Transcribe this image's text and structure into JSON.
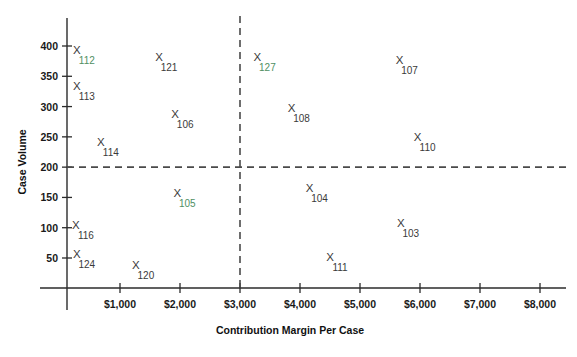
{
  "chart_data": {
    "type": "scatter",
    "title": "",
    "xlabel": "Contribution Margin Per Case",
    "ylabel": "Case Volume",
    "xlim": [
      0,
      8000
    ],
    "ylim": [
      0,
      430
    ],
    "grid": false,
    "legend": null,
    "xticks": [
      1000,
      2000,
      3000,
      4000,
      5000,
      6000,
      7000,
      8000
    ],
    "xtick_labels": [
      "$1,000",
      "$2,000",
      "$3,000",
      "$4,000",
      "$5,000",
      "$6,000",
      "$7,000",
      "$8,000"
    ],
    "yticks": [
      50,
      100,
      150,
      200,
      250,
      300,
      350,
      400
    ],
    "ytick_labels": [
      "50",
      "100",
      "150",
      "200",
      "250",
      "300",
      "350",
      "400"
    ],
    "reference_lines": [
      {
        "name": "volume-threshold",
        "orientation": "horizontal",
        "value": 200,
        "style": "dashed"
      },
      {
        "name": "margin-threshold",
        "orientation": "vertical",
        "value": 3000,
        "style": "dashed"
      }
    ],
    "marker_glyph": "X",
    "points": [
      {
        "label": "112",
        "x": 280,
        "y": 393,
        "tinted": true
      },
      {
        "label": "113",
        "x": 280,
        "y": 334,
        "tinted": false
      },
      {
        "label": "114",
        "x": 680,
        "y": 242,
        "tinted": false
      },
      {
        "label": "116",
        "x": 265,
        "y": 105,
        "tinted": false
      },
      {
        "label": "124",
        "x": 280,
        "y": 57,
        "tinted": false
      },
      {
        "label": "120",
        "x": 1265,
        "y": 38,
        "tinted": false
      },
      {
        "label": "121",
        "x": 1650,
        "y": 382,
        "tinted": false
      },
      {
        "label": "106",
        "x": 1920,
        "y": 288,
        "tinted": false
      },
      {
        "label": "105",
        "x": 1955,
        "y": 157,
        "tinted": true
      },
      {
        "label": "127",
        "x": 3290,
        "y": 382,
        "tinted": true
      },
      {
        "label": "108",
        "x": 3860,
        "y": 298,
        "tinted": false
      },
      {
        "label": "104",
        "x": 4160,
        "y": 166,
        "tinted": false
      },
      {
        "label": "111",
        "x": 4500,
        "y": 52,
        "tinted": false
      },
      {
        "label": "107",
        "x": 5660,
        "y": 377,
        "tinted": false
      },
      {
        "label": "110",
        "x": 5960,
        "y": 250,
        "tinted": false
      },
      {
        "label": "103",
        "x": 5680,
        "y": 107,
        "tinted": false
      }
    ]
  },
  "colors": {
    "axis": "#2b2b2b",
    "marker": "#3a3a3a",
    "tinted_label": "#4f8f63",
    "background": "#ffffff"
  }
}
